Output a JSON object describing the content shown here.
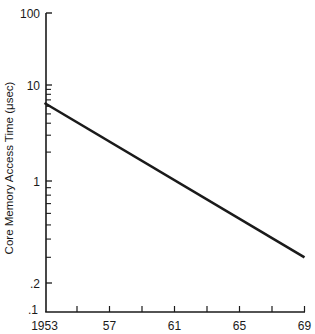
{
  "chart_data": {
    "type": "line",
    "title": "",
    "xlabel": "",
    "ylabel": "Core Memory Access Time (μsec)",
    "yscale": "log",
    "xlim": [
      1953,
      1969
    ],
    "ylim": [
      0.1,
      100
    ],
    "grid": false,
    "legend": "none",
    "x_ticks": [
      {
        "value": 1953,
        "label": "1953"
      },
      {
        "value": 1955,
        "label": ""
      },
      {
        "value": 1957,
        "label": "57"
      },
      {
        "value": 1959,
        "label": ""
      },
      {
        "value": 1961,
        "label": "61"
      },
      {
        "value": 1963,
        "label": ""
      },
      {
        "value": 1965,
        "label": "65"
      },
      {
        "value": 1967,
        "label": ""
      },
      {
        "value": 1969,
        "label": "69"
      }
    ],
    "y_major_ticks": [
      {
        "value": 100,
        "label": "100"
      },
      {
        "value": 10,
        "label": "10"
      },
      {
        "value": 1,
        "label": "1"
      },
      {
        "value": 0.2,
        "label": ".2"
      },
      {
        "value": 0.1,
        "label": ".1"
      }
    ],
    "y_minor_ticks": [
      9,
      8,
      7,
      6,
      5,
      4,
      3,
      2,
      0.9,
      0.8,
      0.7,
      0.6,
      0.5,
      0.4,
      0.3
    ],
    "series": [
      {
        "name": "Core memory access time",
        "color": "#1a1a1a",
        "x": [
          1953,
          1969
        ],
        "y": [
          6.5,
          0.3
        ]
      }
    ]
  }
}
